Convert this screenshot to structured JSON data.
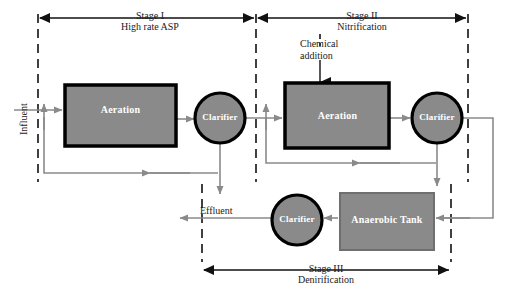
{
  "diagram": {
    "colors": {
      "unit_fill": "#8a8a8a",
      "unit_stroke": "#000000",
      "flow_line": "#808080",
      "stage_line": "#111111",
      "text": "#1a1a1a",
      "unit_text": "#ffffff",
      "background": "#ffffff"
    },
    "stages": [
      {
        "id": "stage-1",
        "name": "Stage I",
        "subtitle": "High rate ASP"
      },
      {
        "id": "stage-2",
        "name": "Stage II",
        "subtitle": "Nitrification"
      },
      {
        "id": "stage-3",
        "name": "Stage III",
        "subtitle": "Denirification"
      }
    ],
    "units": [
      {
        "id": "aeration-1",
        "label": "Aeration",
        "shape": "rectangle",
        "stage": "Stage I"
      },
      {
        "id": "clarifier-1",
        "label": "Clarifier",
        "shape": "circle",
        "stage": "Stage I"
      },
      {
        "id": "aeration-2",
        "label": "Aeration",
        "shape": "rectangle",
        "stage": "Stage II"
      },
      {
        "id": "clarifier-2",
        "label": "Clarifier",
        "shape": "circle",
        "stage": "Stage II"
      },
      {
        "id": "anaerobic-tank",
        "label": "Anaerobic Tank",
        "shape": "rectangle",
        "stage": "Stage III"
      },
      {
        "id": "clarifier-3",
        "label": "Clarifier",
        "shape": "circle",
        "stage": "Stage III"
      }
    ],
    "stream_labels": {
      "influent": "Influent",
      "effluent": "Effluent",
      "chemical_addition": "Chemical\naddition",
      "chemical_addition_line1": "Chemical",
      "chemical_addition_line2": "addition"
    }
  }
}
